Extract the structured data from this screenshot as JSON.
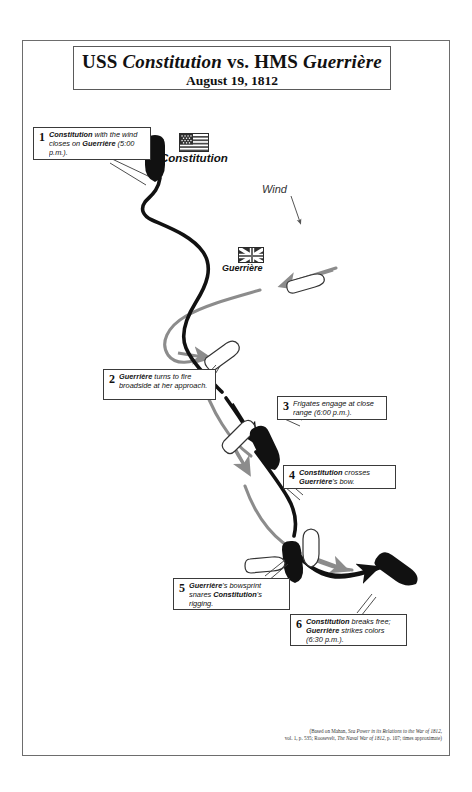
{
  "title": {
    "line1_pre": "USS ",
    "line1_ship1": "Constitution",
    "line1_mid": " vs. HMS ",
    "line1_ship2": "Guerrière",
    "line2": "August 19, 1812"
  },
  "wind": {
    "label": "Wind"
  },
  "ships": {
    "constitution_label": "Constitution",
    "guerriere_label": "Guerrière",
    "us_flag": "united-states-flag",
    "uk_flag": "union-jack-flag"
  },
  "callouts": [
    {
      "num": "1",
      "text": "Constitution with the wind closes on Guerrière (5:00 p.m.).",
      "bold_terms": [
        "Constitution",
        "Guerrière"
      ]
    },
    {
      "num": "2",
      "text": "Guerrière turns to fire broadside at her approach.",
      "bold_terms": [
        "Guerrière"
      ]
    },
    {
      "num": "3",
      "text": "Frigates engage at close range (6:00 p.m.).",
      "bold_terms": []
    },
    {
      "num": "4",
      "text": "Constitution crosses Guerrière's bow.",
      "bold_terms": [
        "Constitution",
        "Guerrière"
      ]
    },
    {
      "num": "5",
      "text": "Guerrière's bowsprit snares Constitution's rigging.",
      "bold_terms": [
        "Guerrière",
        "Constitution"
      ]
    },
    {
      "num": "6",
      "text": "Constitution breaks free; Guerrière strikes colors (6:30 p.m.).",
      "bold_terms": [
        "Constitution",
        "Guerrière"
      ]
    }
  ],
  "credit": {
    "line1_a": "(Based on Mahan, ",
    "line1_i": "Sea Power in its Relations to the War of 1812",
    "line1_b": ",",
    "line2_a": "vol. 1, p. 535; Roosevelt, ",
    "line2_i": "The Naval War of 1812",
    "line2_b": ", p. 107; times approximate)"
  },
  "colors": {
    "constitution_track": "#111111",
    "guerriere_track": "#8c8c8c",
    "frame": "#6d6d6d",
    "flag_red": "#ffffff",
    "ink": "#111111"
  }
}
